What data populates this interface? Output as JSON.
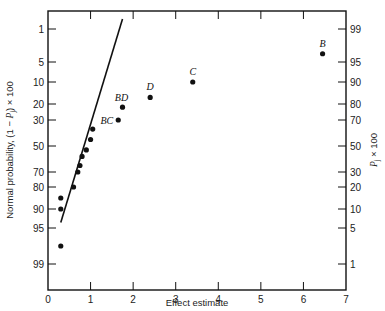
{
  "chart_data": {
    "type": "scatter",
    "title": "",
    "xlabel": "Effect estimate",
    "ylabel_left": "Normal probability, (1 − P_j) × 100",
    "ylabel_right": "P_j × 100",
    "xlim": [
      0,
      7
    ],
    "x_ticks": [
      0,
      1,
      2,
      3,
      4,
      5,
      6,
      7
    ],
    "y_scale": "normal-probability",
    "y_ticks_left": [
      1,
      5,
      10,
      20,
      30,
      50,
      70,
      80,
      90,
      95,
      99
    ],
    "y_ticks_right": [
      99,
      95,
      90,
      80,
      70,
      50,
      30,
      20,
      10,
      5,
      1
    ],
    "grid": false,
    "legend": null,
    "series": [
      {
        "name": "effects",
        "points": [
          {
            "x": 0.3,
            "y": 97,
            "label": ""
          },
          {
            "x": 0.3,
            "y": 90,
            "label": ""
          },
          {
            "x": 0.3,
            "y": 85,
            "label": ""
          },
          {
            "x": 0.6,
            "y": 80,
            "label": ""
          },
          {
            "x": 0.7,
            "y": 70,
            "label": ""
          },
          {
            "x": 0.75,
            "y": 65,
            "label": ""
          },
          {
            "x": 0.8,
            "y": 58,
            "label": ""
          },
          {
            "x": 0.9,
            "y": 53,
            "label": ""
          },
          {
            "x": 1.0,
            "y": 45,
            "label": ""
          },
          {
            "x": 1.05,
            "y": 37,
            "label": ""
          },
          {
            "x": 1.65,
            "y": 30,
            "label": "BC"
          },
          {
            "x": 1.75,
            "y": 22,
            "label": "BD"
          },
          {
            "x": 2.4,
            "y": 17,
            "label": "D"
          },
          {
            "x": 3.4,
            "y": 10,
            "label": "C"
          },
          {
            "x": 6.45,
            "y": 4,
            "label": "B"
          }
        ]
      }
    ],
    "reference_line": {
      "x_start": 0.3,
      "y_start": 92,
      "x_end": 1.75,
      "y_end": 1
    }
  }
}
